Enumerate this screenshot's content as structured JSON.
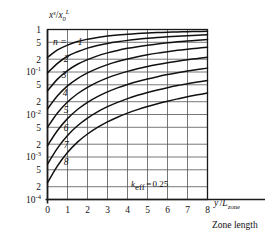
{
  "chart_data": {
    "type": "line",
    "title": "",
    "subtitle": "",
    "xlabel": "y /L_zone",
    "xlabel_parts": {
      "numerator": "y",
      "slash": "/",
      "base": "L",
      "sub": "zone"
    },
    "ylabel": "x^s / x_0^L",
    "ylabel_parts": {
      "x1": "x",
      "sup1": "s",
      "slash": "/",
      "x2": "x",
      "sub2": "0",
      "sup2": "L"
    },
    "bottom_caption": "Zone length",
    "annotation": "k_eff = 0.25",
    "annotation_parts": {
      "symbol": "k",
      "sub": "eff",
      "equals": "=",
      "value": "0.25"
    },
    "xlim": [
      0,
      8
    ],
    "ylim": [
      0.0001,
      1
    ],
    "yscale": "log",
    "xscale": "linear",
    "grid": true,
    "legend_position": "inline-left",
    "xticks": [
      0,
      1,
      2,
      3,
      4,
      5,
      6,
      7,
      8
    ],
    "xtick_labels": [
      "0",
      "1",
      "2",
      "3",
      "4",
      "5",
      "6",
      "7",
      "8"
    ],
    "yticks": [
      1,
      0.5,
      0.2,
      0.1,
      0.05,
      0.02,
      0.01,
      0.005,
      0.002,
      0.001,
      0.0005,
      0.0002,
      0.0001
    ],
    "ytick_labels": [
      {
        "text": "1",
        "sup": ""
      },
      {
        "text": "5",
        "sup": ""
      },
      {
        "text": "2",
        "sup": ""
      },
      {
        "text": "10",
        "sup": "-1"
      },
      {
        "text": "5",
        "sup": ""
      },
      {
        "text": "2",
        "sup": ""
      },
      {
        "text": "10",
        "sup": "-2"
      },
      {
        "text": "5",
        "sup": ""
      },
      {
        "text": "2",
        "sup": ""
      },
      {
        "text": "10",
        "sup": "-3"
      },
      {
        "text": "5",
        "sup": ""
      },
      {
        "text": "2",
        "sup": ""
      },
      {
        "text": "10",
        "sup": "-4"
      }
    ],
    "series_label_prefix": "n =",
    "series": [
      {
        "name": "1",
        "label": "n = 1",
        "x": [
          0,
          0.5,
          1,
          1.5,
          2,
          2.5,
          3,
          3.5,
          4,
          4.5,
          5,
          5.5,
          6,
          6.5,
          7,
          7.5,
          8
        ],
        "values": [
          0.22,
          0.33,
          0.43,
          0.52,
          0.59,
          0.65,
          0.7,
          0.74,
          0.77,
          0.8,
          0.825,
          0.845,
          0.862,
          0.876,
          0.888,
          0.899,
          0.908
        ]
      },
      {
        "name": "2",
        "label": "2",
        "x": [
          0,
          0.5,
          1,
          1.5,
          2,
          2.5,
          3,
          3.5,
          4,
          4.5,
          5,
          5.5,
          6,
          6.5,
          7,
          7.5,
          8
        ],
        "values": [
          0.095,
          0.16,
          0.235,
          0.3,
          0.365,
          0.42,
          0.47,
          0.515,
          0.555,
          0.59,
          0.62,
          0.648,
          0.672,
          0.694,
          0.714,
          0.732,
          0.748
        ]
      },
      {
        "name": "3",
        "label": "3",
        "x": [
          0,
          0.5,
          1,
          1.5,
          2,
          2.5,
          3,
          3.5,
          4,
          4.5,
          5,
          5.5,
          6,
          6.5,
          7,
          7.5,
          8
        ],
        "values": [
          0.036,
          0.068,
          0.108,
          0.152,
          0.196,
          0.24,
          0.282,
          0.322,
          0.36,
          0.395,
          0.428,
          0.458,
          0.486,
          0.512,
          0.536,
          0.558,
          0.578
        ]
      },
      {
        "name": "4",
        "label": "4",
        "x": [
          0,
          0.5,
          1,
          1.5,
          2,
          2.5,
          3,
          3.5,
          4,
          4.5,
          5,
          5.5,
          6,
          6.5,
          7,
          7.5,
          8
        ],
        "values": [
          0.0135,
          0.0275,
          0.047,
          0.07,
          0.095,
          0.122,
          0.149,
          0.176,
          0.203,
          0.229,
          0.254,
          0.278,
          0.301,
          0.323,
          0.344,
          0.364,
          0.383
        ]
      },
      {
        "name": "5",
        "label": "5",
        "x": [
          0,
          0.5,
          1,
          1.5,
          2,
          2.5,
          3,
          3.5,
          4,
          4.5,
          5,
          5.5,
          6,
          6.5,
          7,
          7.5,
          8
        ],
        "values": [
          0.005,
          0.0108,
          0.0196,
          0.0308,
          0.0437,
          0.0578,
          0.0727,
          0.088,
          0.1035,
          0.119,
          0.135,
          0.15,
          0.165,
          0.18,
          0.195,
          0.209,
          0.223
        ]
      },
      {
        "name": "6",
        "label": "6",
        "x": [
          0,
          0.5,
          1,
          1.5,
          2,
          2.5,
          3,
          3.5,
          4,
          4.5,
          5,
          5.5,
          6,
          6.5,
          7,
          7.5,
          8
        ],
        "values": [
          0.00185,
          0.0042,
          0.008,
          0.0131,
          0.0193,
          0.0263,
          0.034,
          0.0422,
          0.0508,
          0.0596,
          0.0686,
          0.0777,
          0.0869,
          0.0961,
          0.1052,
          0.1143,
          0.1233
        ]
      },
      {
        "name": "7",
        "label": "7",
        "x": [
          0,
          0.5,
          1,
          1.5,
          2,
          2.5,
          3,
          3.5,
          4,
          4.5,
          5,
          5.5,
          6,
          6.5,
          7,
          7.5,
          8
        ],
        "values": [
          0.00068,
          0.00162,
          0.00322,
          0.00545,
          0.00826,
          0.01155,
          0.01527,
          0.01933,
          0.02367,
          0.02823,
          0.03297,
          0.03784,
          0.04282,
          0.04788,
          0.053,
          0.05815,
          0.06333
        ]
      },
      {
        "name": "8",
        "label": "8",
        "x": [
          0,
          0.5,
          1,
          1.5,
          2,
          2.5,
          3,
          3.5,
          4,
          4.5,
          5,
          5.5,
          6,
          6.5,
          7,
          7.5,
          8
        ],
        "values": [
          0.00025,
          0.00062,
          0.00128,
          0.00224,
          0.00348,
          0.00498,
          0.00671,
          0.00864,
          0.01075,
          0.01302,
          0.01543,
          0.01796,
          0.0206,
          0.02333,
          0.02614,
          0.02902,
          0.03196
        ]
      }
    ]
  },
  "style": {
    "axis_color": "#1a1a1a",
    "grid_color": "#555555",
    "curve_color": "#111111",
    "background": "#ffffff"
  }
}
